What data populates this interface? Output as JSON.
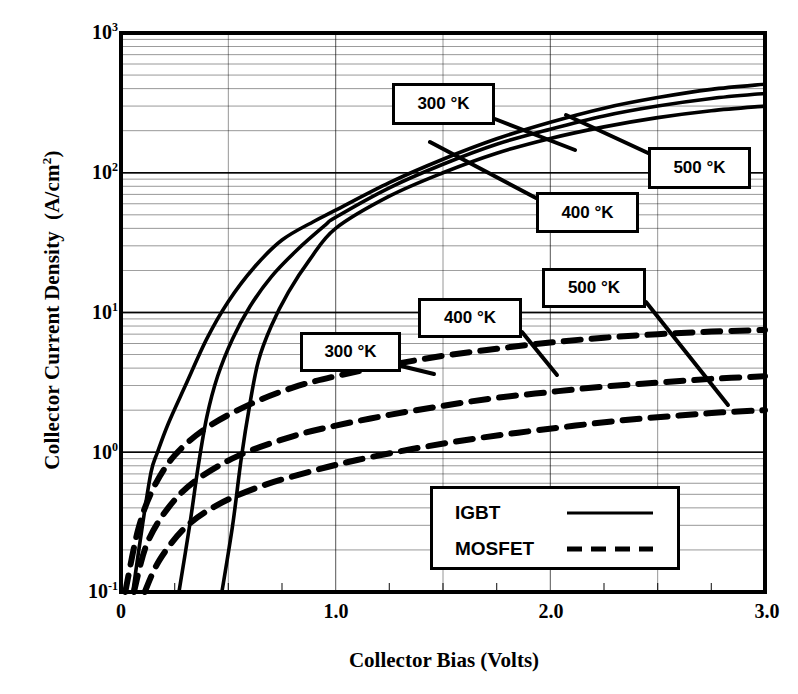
{
  "chart_data": {
    "type": "line",
    "title": "",
    "xlabel": "Collector Bias  (Volts)",
    "ylabel": "Collector Current Density  (A/cm2)",
    "ylabel_plain": "Collector Current Density",
    "ylabel_units": "(A/cm",
    "ylabel_units_sup": "2",
    "ylabel_units_close": ")",
    "xlim": [
      0,
      3.0
    ],
    "ylim": [
      0.1,
      1000
    ],
    "yscale": "log",
    "xscale": "linear",
    "grid": "log-minor-horizontal-and-major-vertical",
    "legend_position": "lower-center-right",
    "xticks": [
      "0",
      "1.0",
      "2.0",
      "3.0"
    ],
    "xtick_values": [
      0,
      1.0,
      2.0,
      3.0
    ],
    "yticks": [
      "10-1",
      "100",
      "101",
      "102",
      "103"
    ],
    "ytick_bases": [
      "10",
      "10",
      "10",
      "10",
      "10"
    ],
    "ytick_exps": [
      "-1",
      "0",
      "1",
      "2",
      "3"
    ],
    "ytick_values": [
      0.1,
      1,
      10,
      100,
      1000
    ],
    "series": [
      {
        "name": "IGBT 300 K",
        "device": "IGBT",
        "temperature": "300 °K",
        "style": "solid",
        "points": [
          [
            0.055,
            0.1
          ],
          [
            0.1,
            0.3
          ],
          [
            0.14,
            0.72
          ],
          [
            0.17,
            1.0
          ],
          [
            0.22,
            1.6
          ],
          [
            0.3,
            3.0
          ],
          [
            0.4,
            6.5
          ],
          [
            0.5,
            12
          ],
          [
            0.62,
            21
          ],
          [
            0.75,
            33
          ],
          [
            0.9,
            45
          ],
          [
            1.0,
            54
          ],
          [
            1.25,
            85
          ],
          [
            1.5,
            125
          ],
          [
            1.75,
            175
          ],
          [
            2.0,
            230
          ],
          [
            2.25,
            290
          ],
          [
            2.5,
            345
          ],
          [
            2.75,
            395
          ],
          [
            3.0,
            430
          ]
        ]
      },
      {
        "name": "IGBT 400 K",
        "device": "IGBT",
        "temperature": "400 °K",
        "style": "solid",
        "points": [
          [
            0.27,
            0.1
          ],
          [
            0.32,
            0.3
          ],
          [
            0.36,
            0.8
          ],
          [
            0.4,
            1.8
          ],
          [
            0.45,
            3.5
          ],
          [
            0.52,
            6.5
          ],
          [
            0.6,
            11
          ],
          [
            0.7,
            18
          ],
          [
            0.82,
            28
          ],
          [
            0.95,
            42
          ],
          [
            1.0,
            48
          ],
          [
            1.25,
            78
          ],
          [
            1.5,
            115
          ],
          [
            1.75,
            160
          ],
          [
            2.0,
            205
          ],
          [
            2.25,
            255
          ],
          [
            2.5,
            300
          ],
          [
            2.75,
            340
          ],
          [
            3.0,
            370
          ]
        ]
      },
      {
        "name": "IGBT 500 K",
        "device": "IGBT",
        "temperature": "500 °K",
        "style": "solid",
        "points": [
          [
            0.47,
            0.1
          ],
          [
            0.52,
            0.3
          ],
          [
            0.56,
            0.9
          ],
          [
            0.6,
            2.2
          ],
          [
            0.64,
            4.5
          ],
          [
            0.7,
            8.0
          ],
          [
            0.78,
            14
          ],
          [
            0.88,
            24
          ],
          [
            1.0,
            40
          ],
          [
            1.25,
            68
          ],
          [
            1.5,
            100
          ],
          [
            1.75,
            138
          ],
          [
            2.0,
            176
          ],
          [
            2.25,
            213
          ],
          [
            2.5,
            248
          ],
          [
            2.75,
            278
          ],
          [
            3.0,
            300
          ]
        ]
      },
      {
        "name": "MOSFET 300 K",
        "device": "MOSFET",
        "temperature": "300 °K",
        "style": "dashed",
        "points": [
          [
            0.02,
            0.1
          ],
          [
            0.08,
            0.28
          ],
          [
            0.15,
            0.55
          ],
          [
            0.25,
            0.95
          ],
          [
            0.4,
            1.5
          ],
          [
            0.6,
            2.2
          ],
          [
            0.8,
            2.9
          ],
          [
            1.0,
            3.5
          ],
          [
            1.25,
            4.2
          ],
          [
            1.5,
            4.9
          ],
          [
            1.75,
            5.5
          ],
          [
            2.0,
            6.1
          ],
          [
            2.25,
            6.6
          ],
          [
            2.5,
            7.0
          ],
          [
            2.75,
            7.3
          ],
          [
            3.0,
            7.5
          ]
        ]
      },
      {
        "name": "MOSFET 400 K",
        "device": "MOSFET",
        "temperature": "400 °K",
        "style": "dashed",
        "points": [
          [
            0.06,
            0.1
          ],
          [
            0.12,
            0.22
          ],
          [
            0.22,
            0.4
          ],
          [
            0.35,
            0.63
          ],
          [
            0.55,
            0.95
          ],
          [
            0.8,
            1.3
          ],
          [
            1.0,
            1.55
          ],
          [
            1.25,
            1.85
          ],
          [
            1.5,
            2.15
          ],
          [
            1.75,
            2.45
          ],
          [
            2.0,
            2.7
          ],
          [
            2.25,
            2.95
          ],
          [
            2.5,
            3.15
          ],
          [
            2.75,
            3.35
          ],
          [
            3.0,
            3.5
          ]
        ]
      },
      {
        "name": "MOSFET 500 K",
        "device": "MOSFET",
        "temperature": "500 °K",
        "style": "dashed",
        "points": [
          [
            0.11,
            0.1
          ],
          [
            0.18,
            0.17
          ],
          [
            0.3,
            0.29
          ],
          [
            0.45,
            0.42
          ],
          [
            0.65,
            0.57
          ],
          [
            0.9,
            0.74
          ],
          [
            1.1,
            0.88
          ],
          [
            1.35,
            1.05
          ],
          [
            1.6,
            1.22
          ],
          [
            1.85,
            1.38
          ],
          [
            2.1,
            1.54
          ],
          [
            2.35,
            1.7
          ],
          [
            2.6,
            1.83
          ],
          [
            2.8,
            1.93
          ],
          [
            3.0,
            2.0
          ]
        ]
      }
    ],
    "annotations": [
      {
        "id": "igbt-300",
        "label": "300 °K",
        "box": [
          392,
          83,
          103,
          42
        ],
        "leader_to": [
          575,
          150
        ]
      },
      {
        "id": "igbt-500",
        "label": "500 °K",
        "box": [
          648,
          147,
          103,
          42
        ],
        "leader_to": [
          566,
          115
        ]
      },
      {
        "id": "igbt-400",
        "label": "400 °K",
        "box": [
          536,
          192,
          103,
          41
        ],
        "leader_to": [
          430,
          142
        ]
      },
      {
        "id": "mosfet-500",
        "label": "500 °K",
        "box": [
          542,
          268,
          104,
          40
        ],
        "leader_to": [
          728,
          405
        ]
      },
      {
        "id": "mosfet-400",
        "label": "400 °K",
        "box": [
          418,
          298,
          104,
          40
        ],
        "leader_to": [
          557,
          375
        ]
      },
      {
        "id": "mosfet-300",
        "label": "300 °K",
        "box": [
          300,
          332,
          101,
          40
        ],
        "leader_to": [
          434,
          374
        ]
      }
    ],
    "legend": {
      "box": [
        430,
        486,
        250,
        84
      ],
      "entries": [
        {
          "label": "IGBT",
          "style": "solid"
        },
        {
          "label": "MOSFET",
          "style": "dashed"
        }
      ]
    }
  }
}
